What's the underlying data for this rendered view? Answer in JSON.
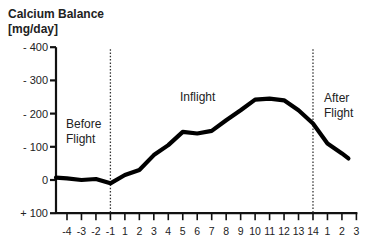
{
  "chart_data": {
    "type": "line",
    "title": "Calcium Balance",
    "ylabel": "[mg/day]",
    "xlabel": "",
    "ylim": [
      -400,
      100
    ],
    "y_inverted": true,
    "y_ticks": [
      {
        "value": -400,
        "label": "- 400"
      },
      {
        "value": -300,
        "label": "- 300"
      },
      {
        "value": -200,
        "label": "- 200"
      },
      {
        "value": -100,
        "label": "- 100"
      },
      {
        "value": 0,
        "label": "0"
      },
      {
        "value": 100,
        "label": "+ 100"
      }
    ],
    "categories": [
      "-4",
      "-3",
      "-2",
      "-1",
      "1",
      "2",
      "3",
      "4",
      "5",
      "6",
      "7",
      "8",
      "9",
      "10",
      "11",
      "12",
      "13",
      "14",
      "1",
      "2",
      "3"
    ],
    "series": [
      {
        "name": "Calcium Balance",
        "values": [
          -5,
          0,
          -3,
          10,
          -15,
          -30,
          -75,
          -105,
          -145,
          -140,
          -148,
          -180,
          -210,
          -242,
          -245,
          -240,
          -210,
          -170,
          -110,
          -80,
          -65
        ]
      }
    ],
    "phases": [
      {
        "label_line1": "Before",
        "label_line2": "Flight"
      },
      {
        "label_line1": "Inflight",
        "label_line2": ""
      },
      {
        "label_line1": "After",
        "label_line2": "Flight"
      }
    ],
    "phase_dividers_at": [
      "-1",
      "14"
    ],
    "grid": false,
    "legend": "none"
  }
}
